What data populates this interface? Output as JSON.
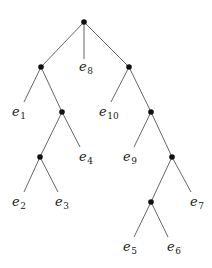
{
  "diagram": {
    "type": "rooted-tree",
    "colors": {
      "edge": "#555555",
      "node": "#111111",
      "label": "#222222",
      "background": "#ffffff"
    },
    "internal_nodes": [
      {
        "id": "root",
        "x": 84,
        "y": 22
      },
      {
        "id": "L1",
        "x": 41,
        "y": 67
      },
      {
        "id": "R1",
        "x": 129,
        "y": 67
      },
      {
        "id": "L2",
        "x": 62,
        "y": 112
      },
      {
        "id": "R2",
        "x": 151,
        "y": 112
      },
      {
        "id": "L3",
        "x": 40,
        "y": 157
      },
      {
        "id": "R3",
        "x": 172,
        "y": 157
      },
      {
        "id": "R4",
        "x": 151,
        "y": 202
      }
    ],
    "leaves": [
      {
        "id": "e1",
        "base": "e",
        "sub": "1",
        "parent": "L1",
        "end": [
          24,
          102
        ],
        "label_pos": [
          12,
          116
        ]
      },
      {
        "id": "e2",
        "base": "e",
        "sub": "2",
        "parent": "L3",
        "end": [
          24,
          192
        ],
        "label_pos": [
          12,
          206
        ]
      },
      {
        "id": "e3",
        "base": "e",
        "sub": "3",
        "parent": "L3",
        "end": [
          58,
          192
        ],
        "label_pos": [
          55,
          206
        ]
      },
      {
        "id": "e4",
        "base": "e",
        "sub": "4",
        "parent": "L2",
        "end": [
          80,
          147
        ],
        "label_pos": [
          79,
          161
        ]
      },
      {
        "id": "e5",
        "base": "e",
        "sub": "5",
        "parent": "R4",
        "end": [
          134,
          237
        ],
        "label_pos": [
          123,
          251
        ]
      },
      {
        "id": "e6",
        "base": "e",
        "sub": "6",
        "parent": "R4",
        "end": [
          168,
          237
        ],
        "label_pos": [
          167,
          251
        ]
      },
      {
        "id": "e7",
        "base": "e",
        "sub": "7",
        "parent": "R3",
        "end": [
          191,
          192
        ],
        "label_pos": [
          190,
          206
        ]
      },
      {
        "id": "e8",
        "base": "e",
        "sub": "8",
        "parent": "root",
        "end": [
          84,
          59
        ],
        "label_pos": [
          79,
          71
        ]
      },
      {
        "id": "e9",
        "base": "e",
        "sub": "9",
        "parent": "R2",
        "end": [
          134,
          147
        ],
        "label_pos": [
          123,
          161
        ]
      },
      {
        "id": "e10",
        "base": "e",
        "sub": "10",
        "parent": "R1",
        "end": [
          111,
          102
        ],
        "label_pos": [
          99,
          116
        ]
      }
    ],
    "internal_edges": [
      [
        "root",
        "L1"
      ],
      [
        "root",
        "R1"
      ],
      [
        "L1",
        "L2"
      ],
      [
        "L2",
        "L3"
      ],
      [
        "R1",
        "R2"
      ],
      [
        "R2",
        "R3"
      ],
      [
        "R3",
        "R4"
      ]
    ]
  }
}
